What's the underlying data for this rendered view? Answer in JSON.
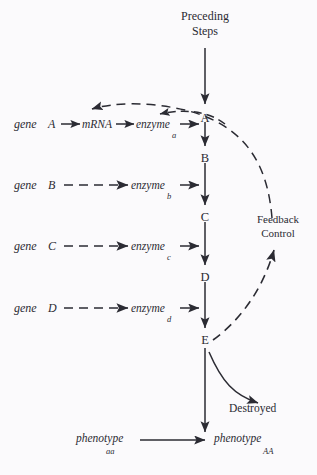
{
  "figure": {
    "background": "#fbfafc",
    "ink": "#2b2b33"
  },
  "header": {
    "line1": "Preceding",
    "line2": "Steps"
  },
  "chain": {
    "label": "metabolic-pathway-chain",
    "nodes": [
      {
        "letter": "A",
        "x": 205,
        "y": 118
      },
      {
        "letter": "B",
        "x": 205,
        "y": 158
      },
      {
        "letter": "C",
        "x": 205,
        "y": 217
      },
      {
        "letter": "D",
        "x": 205,
        "y": 277
      },
      {
        "letter": "E",
        "x": 205,
        "y": 340
      }
    ]
  },
  "rows": [
    {
      "gene_word": "gene",
      "gene_letter": "A",
      "mrna": "mRNA",
      "enzyme_word": "enzyme",
      "enzyme_sub": "a",
      "arrow_style": "solid",
      "y": 127
    },
    {
      "gene_word": "gene",
      "gene_letter": "B",
      "mrna": null,
      "enzyme_word": "enzyme",
      "enzyme_sub": "b",
      "arrow_style": "dashed",
      "y": 188
    },
    {
      "gene_word": "gene",
      "gene_letter": "C",
      "mrna": null,
      "enzyme_word": "enzyme",
      "enzyme_sub": "c",
      "arrow_style": "dashed",
      "y": 248
    },
    {
      "gene_word": "gene",
      "gene_letter": "D",
      "mrna": null,
      "enzyme_word": "enzyme",
      "enzyme_sub": "d",
      "arrow_style": "dashed",
      "y": 311
    }
  ],
  "feedback": {
    "line1": "Feedback",
    "line2": "Control"
  },
  "destroyed": {
    "label": "Destroyed"
  },
  "phenotypes": {
    "left_word": "phenotype",
    "left_sub": "aa",
    "right_word": "phenotype",
    "right_sub": "AA"
  }
}
